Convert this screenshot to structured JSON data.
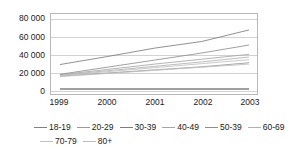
{
  "chart_data": {
    "type": "line",
    "title": "",
    "subtitle": "",
    "xlabel": "",
    "ylabel": "",
    "categories": [
      "1999",
      "2000",
      "2001",
      "2002",
      "2003"
    ],
    "x": [
      1999,
      2000,
      2001,
      2002,
      2003
    ],
    "ylim": [
      0,
      90000
    ],
    "yticks": [
      0,
      20000,
      40000,
      60000,
      80000
    ],
    "ytick_labels": [
      "0",
      "20 000",
      "40 000",
      "60 000",
      "80 000"
    ],
    "grid": true,
    "grid_axis": "y",
    "legend_position": "bottom",
    "series": [
      {
        "name": "18-19",
        "color": "#808080",
        "values": [
          400,
          400,
          400,
          400,
          400
        ]
      },
      {
        "name": "20-29",
        "color": "#9a9a9a",
        "values": [
          15000,
          18500,
          22000,
          25500,
          30000
        ]
      },
      {
        "name": "30-39",
        "color": "#7d7d7d",
        "values": [
          28000,
          37000,
          46500,
          54000,
          67000
        ]
      },
      {
        "name": "40-49",
        "color": "#a5a5a5",
        "values": [
          16500,
          22500,
          28500,
          34000,
          39500
        ]
      },
      {
        "name": "50-39",
        "color": "#8f8f8f",
        "values": [
          17000,
          25000,
          33000,
          41000,
          50000
        ]
      },
      {
        "name": "60-69",
        "color": "#b0b0b0",
        "values": [
          16000,
          21000,
          26000,
          31000,
          36500
        ]
      },
      {
        "name": "70-79",
        "color": "#c0c0c0",
        "values": [
          15500,
          20000,
          24500,
          29000,
          33500
        ]
      },
      {
        "name": "80+",
        "color": "#bdbdbd",
        "values": [
          14500,
          18000,
          21500,
          25000,
          28500
        ]
      }
    ]
  },
  "axes": {
    "y_tick_labels": [
      "80 000",
      "60 000",
      "40 000",
      "20 000",
      "0"
    ],
    "x_tick_labels": [
      "1999",
      "2000",
      "2001",
      "2002",
      "2003"
    ]
  },
  "legend": {
    "row1": [
      "18-19",
      "20-29",
      "30-39",
      "40-49",
      "50-39",
      "60-69"
    ],
    "row2": [
      "70-79",
      "80+"
    ]
  }
}
